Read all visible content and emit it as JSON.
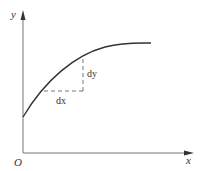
{
  "diagram": {
    "type": "derivative-illustration",
    "axes": {
      "x_label": "x",
      "y_label": "y",
      "origin_label": "O"
    },
    "increments": {
      "dx_label": "dx",
      "dy_label": "dy"
    },
    "colors": {
      "axis": "#777777",
      "curve": "#333333",
      "dashed": "#666666",
      "text": "#333333"
    }
  }
}
